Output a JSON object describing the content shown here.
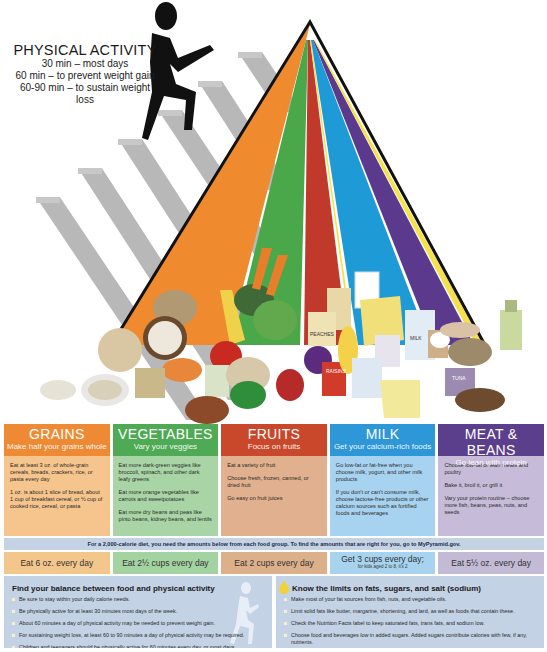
{
  "physical_activity": {
    "title": "PHYSICAL ACTIVITY",
    "lines": [
      "30 min – most days",
      "60 min – to prevent weight gain",
      "60-90 min – to sustain weight loss"
    ]
  },
  "pyramid": {
    "bands": [
      {
        "group": "grains",
        "color": "#ef8a2e"
      },
      {
        "group": "vegetables",
        "color": "#4aa84b"
      },
      {
        "group": "fruits",
        "color": "#c0392b"
      },
      {
        "group": "oils",
        "color": "#f5e14a"
      },
      {
        "group": "milk",
        "color": "#1e9ad6"
      },
      {
        "group": "meat_beans",
        "color": "#5b3a8e"
      }
    ],
    "food_labels": [
      "PEACHES",
      "RAISINS",
      "MILK",
      "TUNA"
    ]
  },
  "groups": [
    {
      "name": "GRAINS",
      "subtitle": "Make half your grains whole",
      "head_color": "#ef8a34",
      "body_color": "#f6c58d",
      "tips": [
        "Eat at least 3 oz. of whole-grain cereals, breads, crackers, rice, or pasta every day",
        "1 oz. is about 1 slice of bread, about 1 cup of breakfast cereal, or ½ cup of cooked rice, cereal, or pasta"
      ],
      "amount": "Eat 6 oz. every day",
      "amount_color": "#f3c68c"
    },
    {
      "name": "VEGETABLES",
      "subtitle": "Vary your veggies",
      "head_color": "#4faa55",
      "body_color": "#a9d5a6",
      "tips": [
        "Eat more dark-green veggies like broccoli, spinach, and other dark leafy greens",
        "Eat more orange vegetables like carrots and sweetpotatoes",
        "Eat more dry beans and peas like pinto beans, kidney beans, and lentils"
      ],
      "amount": "Eat 2½ cups every day",
      "amount_color": "#a4d3a2"
    },
    {
      "name": "FRUITS",
      "subtitle": "Focus on fruits",
      "head_color": "#c9472a",
      "body_color": "#e1b08e",
      "tips": [
        "Eat a variety of fruit",
        "Choose fresh, frozen, canned, or dried fruit",
        "Go easy on fruit juices"
      ],
      "amount": "Eat 2 cups every day",
      "amount_color": "#ddb08c"
    },
    {
      "name": "MILK",
      "subtitle": "Get your calcium-rich foods",
      "head_color": "#2d97d8",
      "body_color": "#a8d3f0",
      "tips": [
        "Go low-fat or fat-free when you choose milk, yogurt, and other milk products",
        "If you don't or can't consume milk, choose lactose-free products or other calcium sources such as fortified foods and beverages"
      ],
      "amount": "Get 3 cups every day;",
      "amount_note": "for kids aged 2 to 8, it's 2",
      "amount_color": "#a7d3ef"
    },
    {
      "name": "MEAT & BEANS",
      "subtitle": "Go lean with protein",
      "head_color": "#5b3f8c",
      "body_color": "#c6bcd9",
      "tips": [
        "Choose low-fat or lean meats and poultry",
        "Bake it, broil it, or grill it",
        "Vary your protein routine – choose more fish, beans, peas, nuts, and seeds"
      ],
      "amount": "Eat 5½ oz. every day",
      "amount_color": "#c3bbd6"
    }
  ],
  "banner": "For a 2,000-calorie diet, you need the amounts below from each food group. To find the amounts that are right for you, go to MyPyramid.gov.",
  "panels": [
    {
      "title": "Find your balance between food and physical activity",
      "items": [
        "Be sure to stay within your daily calorie needs.",
        "Be physically active for at least 30 minutes most days of the week.",
        "About 60 minutes a day of physical activity may be needed to prevent weight gain.",
        "For sustaining weight loss, at least 60 to 90 minutes a day of physical activity may be required.",
        "Children and teenagers should be physically active for 60 minutes every day, or most days."
      ]
    },
    {
      "title": "Know the limits on fats, sugars, and salt (sodium)",
      "items": [
        "Make most of your fat sources from fish, nuts, and vegetable oils.",
        "Limit solid fats like butter, margarine, shortening, and lard, as well as foods that contain these.",
        "Check the Nutrition Facts label to keep saturated fats, trans fats, and sodium low.",
        "Choose food and beverages low in added sugars. Added sugars contribute calories with few, if any, nutrients."
      ]
    }
  ]
}
